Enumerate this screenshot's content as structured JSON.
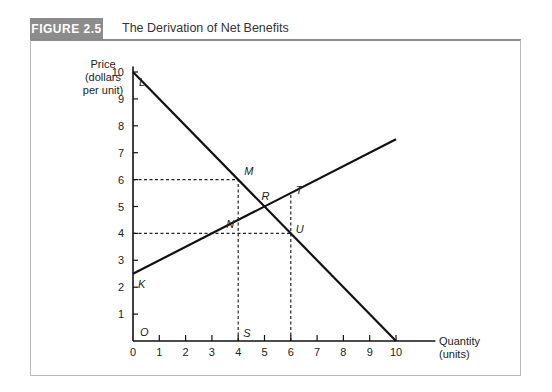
{
  "figure": {
    "label": "FIGURE 2.5",
    "title": "The Derivation of Net Benefits"
  },
  "chart_data": {
    "type": "line",
    "title": "The Derivation of Net Benefits",
    "xlabel": "Quantity (units)",
    "ylabel": "Price (dollars per unit)",
    "xlim": [
      0,
      10
    ],
    "ylim": [
      0,
      10
    ],
    "xticks": [
      0,
      1,
      2,
      3,
      4,
      5,
      6,
      7,
      8,
      9,
      10
    ],
    "yticks": [
      1,
      2,
      3,
      4,
      5,
      6,
      7,
      8,
      9,
      10
    ],
    "grid": false,
    "series": [
      {
        "name": "Demand (LR)",
        "x": [
          0,
          10
        ],
        "y": [
          10,
          0
        ]
      },
      {
        "name": "Supply (KT)",
        "x": [
          0,
          10
        ],
        "y": [
          2.5,
          7.5
        ]
      }
    ],
    "points": [
      {
        "label": "L",
        "x": 0,
        "y": 10
      },
      {
        "label": "K",
        "x": 0,
        "y": 2.5
      },
      {
        "label": "M",
        "x": 4,
        "y": 6
      },
      {
        "label": "N",
        "x": 4,
        "y": 4.5
      },
      {
        "label": "R",
        "x": 5,
        "y": 5
      },
      {
        "label": "T",
        "x": 6,
        "y": 5.5
      },
      {
        "label": "U",
        "x": 6,
        "y": 4
      },
      {
        "label": "S",
        "x": 4,
        "y": 0
      },
      {
        "label": "O",
        "x": 0,
        "y": 0
      }
    ],
    "dashed_guides": [
      {
        "from": [
          0,
          6
        ],
        "to": [
          4,
          6
        ]
      },
      {
        "from": [
          0,
          4
        ],
        "to": [
          6,
          4
        ]
      },
      {
        "from": [
          4,
          0
        ],
        "to": [
          4,
          6
        ]
      },
      {
        "from": [
          6,
          0
        ],
        "to": [
          6,
          5.5
        ]
      }
    ]
  },
  "axis": {
    "y_label_lines": [
      "Price",
      "(dollars",
      "per unit)"
    ],
    "x_label_lines": [
      "Quantity",
      "(units)"
    ]
  }
}
